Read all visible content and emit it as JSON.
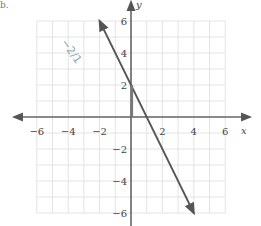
{
  "corner_label": "b.",
  "chart_data": {
    "type": "line",
    "title": "",
    "xlabel": "x",
    "ylabel": "y",
    "xlim": [
      -6,
      6
    ],
    "ylim": [
      -6,
      6
    ],
    "grid": true,
    "x_ticks": [
      -6,
      -4,
      -2,
      2,
      4,
      6
    ],
    "y_ticks": [
      6,
      4,
      2,
      -2,
      -4,
      -6
    ],
    "x_tick_labels": [
      "−6",
      "−4",
      "−2",
      "2",
      "4",
      "6"
    ],
    "y_tick_labels": [
      "6",
      "4",
      "2",
      "−2",
      "−4",
      "−6"
    ],
    "series": [
      {
        "name": "line",
        "equation": "y = -2x + 2",
        "slope": -2,
        "y_intercept": 2,
        "x_intercept": 1,
        "points": [
          [
            -2,
            6
          ],
          [
            0,
            2
          ],
          [
            1,
            0
          ],
          [
            4,
            -6
          ]
        ],
        "arrows": "both",
        "color": "#555555"
      }
    ],
    "annotations": [
      {
        "type": "segment",
        "from": [
          0,
          0
        ],
        "to": [
          0,
          2
        ],
        "note": "rise highlight"
      },
      {
        "type": "handwritten",
        "text": "−2/1",
        "position": [
          -4.5,
          4.5
        ]
      }
    ]
  }
}
